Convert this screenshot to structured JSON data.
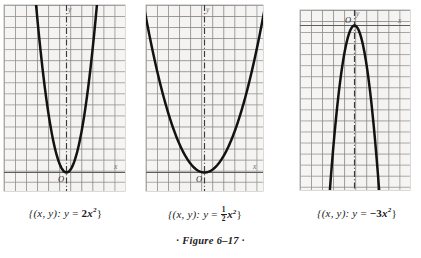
{
  "figure": {
    "caption": "· Figure 6–17 ·",
    "label": "Figure 6-17"
  },
  "panels": [
    {
      "id": "panel-1",
      "axis_x_label": "x",
      "axis_y_label": "y",
      "origin_label": "O",
      "caption_prefix": "{(x, y): y",
      "caption_equals": "=",
      "caption_coefficient": "2",
      "caption_variable": "x",
      "caption_exponent": "2",
      "caption_suffix": "}",
      "caption_plain": "{(x, y): y = 2x²}",
      "chart_data": {
        "type": "line",
        "title": "{(x, y): y = 2x²}",
        "equation": "y = 2x^2",
        "coefficient": 2,
        "opens": "up",
        "vertex": [
          0,
          0
        ],
        "xlabel": "x",
        "ylabel": "y",
        "grid": true,
        "xlim": [
          -6,
          5
        ],
        "ylim": [
          -2,
          15
        ],
        "x": [
          -2.7,
          -2.4,
          -2.1,
          -1.8,
          -1.5,
          -1.2,
          -0.9,
          -0.6,
          -0.3,
          0,
          0.3,
          0.6,
          0.9,
          1.2,
          1.5,
          1.8,
          2.1,
          2.4,
          2.7
        ],
        "y": [
          14.58,
          11.52,
          8.82,
          6.48,
          4.5,
          2.88,
          1.62,
          0.72,
          0.18,
          0,
          0.18,
          0.72,
          1.62,
          2.88,
          4.5,
          6.48,
          8.82,
          11.52,
          14.58
        ]
      }
    },
    {
      "id": "panel-2",
      "axis_x_label": "x",
      "axis_y_label": "y",
      "origin_label": "O",
      "caption_prefix": "{(x, y): y",
      "caption_equals": "=",
      "caption_numerator": "1",
      "caption_denominator": "2",
      "caption_variable": "x",
      "caption_exponent": "2",
      "caption_suffix": "}",
      "caption_plain": "{(x, y): y = ½x²}",
      "chart_data": {
        "type": "line",
        "title": "{(x, y): y = 1/2 x²}",
        "equation": "y = (1/2)x^2",
        "coefficient": 0.5,
        "opens": "up",
        "vertex": [
          0,
          0
        ],
        "xlabel": "x",
        "ylabel": "y",
        "grid": true,
        "xlim": [
          -6,
          5
        ],
        "ylim": [
          -2,
          15
        ],
        "x": [
          -5.4,
          -4.8,
          -4.2,
          -3.6,
          -3.0,
          -2.4,
          -1.8,
          -1.2,
          -0.6,
          0,
          0.6,
          1.2,
          1.8,
          2.4,
          3.0,
          3.6,
          4.2,
          4.8,
          5.4
        ],
        "y": [
          14.58,
          11.52,
          8.82,
          6.48,
          4.5,
          2.88,
          1.62,
          0.72,
          0.18,
          0,
          0.18,
          0.72,
          1.62,
          2.88,
          4.5,
          6.48,
          8.82,
          11.52,
          14.58
        ]
      }
    },
    {
      "id": "panel-3",
      "axis_x_label": "x",
      "axis_y_label": "y",
      "origin_label": "O",
      "caption_prefix": "{(x, y): y",
      "caption_equals": "=",
      "caption_coefficient": "−3",
      "caption_variable": "x",
      "caption_exponent": "2",
      "caption_suffix": "}",
      "caption_plain": "{(x, y): y = −3x²}",
      "chart_data": {
        "type": "line",
        "title": "{(x, y): y = −3x²}",
        "equation": "y = -3x^2",
        "coefficient": -3,
        "opens": "down",
        "vertex": [
          0,
          0
        ],
        "xlabel": "x",
        "ylabel": "y",
        "grid": true,
        "xlim": [
          -5,
          5
        ],
        "ylim": [
          -15,
          2
        ],
        "x": [
          -2.2,
          -2.0,
          -1.8,
          -1.6,
          -1.4,
          -1.2,
          -1.0,
          -0.8,
          -0.6,
          -0.4,
          -0.2,
          0,
          0.2,
          0.4,
          0.6,
          0.8,
          1.0,
          1.2,
          1.4,
          1.6,
          1.8,
          2.0,
          2.2
        ],
        "y": [
          -14.52,
          -12.0,
          -9.72,
          -7.68,
          -5.88,
          -4.32,
          -3.0,
          -1.92,
          -1.08,
          -0.48,
          -0.12,
          0,
          -0.12,
          -0.48,
          -1.08,
          -1.92,
          -3.0,
          -4.32,
          -5.88,
          -7.68,
          -9.72,
          -12.0,
          -14.52
        ]
      }
    }
  ],
  "colors": {
    "curve": "#121212",
    "grid": "#848484",
    "paper": "#f4f3f1",
    "axis": "#5d5d5d",
    "text": "#1b1b1b"
  }
}
